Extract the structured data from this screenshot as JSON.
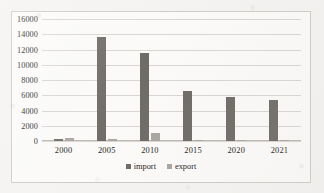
{
  "chart_data": {
    "type": "bar",
    "title": "",
    "xlabel": "",
    "ylabel": "",
    "categories": [
      "2000",
      "2005",
      "2010",
      "2015",
      "2020",
      "2021"
    ],
    "series": [
      {
        "name": "import",
        "color": "#6f6c68",
        "values": [
          250,
          13600,
          11600,
          6500,
          5800,
          5400
        ]
      },
      {
        "name": "export",
        "color": "#a9a6a2",
        "values": [
          400,
          200,
          1000,
          130,
          180,
          60
        ]
      }
    ],
    "ylim": [
      0,
      16000
    ],
    "ytick_step": 2000,
    "yticks": [
      "16000",
      "14000",
      "12000",
      "10000",
      "8000",
      "6000",
      "4000",
      "2000",
      "0"
    ],
    "grid": true,
    "legend_position": "bottom-center"
  },
  "legend": {
    "import_label": "import",
    "export_label": "export"
  }
}
